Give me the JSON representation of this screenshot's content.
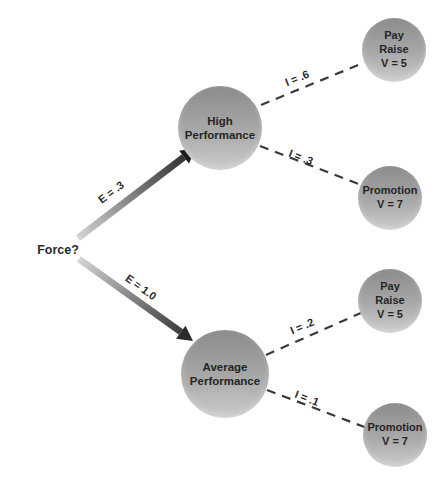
{
  "diagram": {
    "title_hint": "expectancy-theory-decision-tree",
    "root_label": "Force?",
    "branches": [
      {
        "expectancy_label": "E = .3",
        "performance_label": "High\nPerformance",
        "outcomes": [
          {
            "instrumentality_label": "I = .6",
            "label": "Pay\nRaise",
            "value": "V = 5"
          },
          {
            "instrumentality_label": "I = .3",
            "label": "Promotion",
            "value": "V = 7"
          }
        ]
      },
      {
        "expectancy_label": "E = 1.0",
        "performance_label": "Average\nPerformance",
        "outcomes": [
          {
            "instrumentality_label": "I = .2",
            "label": "Pay\nRaise",
            "value": "V = 5"
          },
          {
            "instrumentality_label": "I = .1",
            "label": "Promotion",
            "value": "V = 7"
          }
        ]
      }
    ],
    "colors": {
      "node_gradient_top": "#8b8b8b",
      "node_gradient_bottom": "#cccccc",
      "dashed_link": "#3a3a3a",
      "arrow_tail": "#d4d4d4",
      "arrow_head": "#1f1f1f",
      "text": "#252525",
      "background": "#ffffff"
    }
  }
}
